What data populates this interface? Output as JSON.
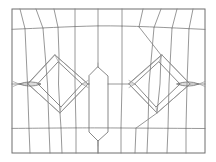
{
  "figure": {
    "kind": "mesh-diagram",
    "caption": "",
    "background_color": "#ffffff",
    "line_color": "#7d7d7d",
    "frame_color": "#6f6f6f",
    "feature_color": "#6a6a6a",
    "faint_color": "#9a9a9a"
  },
  "canvas": {
    "width": 216,
    "height": 162
  },
  "chart_data": {
    "type": "line",
    "xlabel": "",
    "ylabel": "",
    "xlim": [
      0,
      216
    ],
    "ylim": [
      0,
      162
    ],
    "grid": false,
    "legend": "none",
    "annotations": [],
    "frame": {
      "name": "outer-boundary",
      "x0": 12,
      "y0": 9,
      "x1": 205,
      "y1": 153
    },
    "horizontal_gridlines": [
      {
        "name": "top-band-line",
        "y_left": 29,
        "y_mid": 26,
        "y_right": 29,
        "points": [
          [
            12,
            29
          ],
          [
            40,
            28
          ],
          [
            70,
            26.5
          ],
          [
            100,
            25.8
          ],
          [
            130,
            26.2
          ],
          [
            160,
            27.5
          ],
          [
            186,
            28.6
          ],
          [
            205,
            29.2
          ]
        ]
      },
      {
        "name": "mid-band-line",
        "y_left": 84,
        "y_mid": 84,
        "y_right": 84,
        "points": [
          [
            12,
            84
          ],
          [
            52,
            84
          ],
          [
            98,
            84
          ],
          [
            148,
            84
          ],
          [
            205,
            84
          ]
        ]
      },
      {
        "name": "bottom-band-line",
        "y_left": 128,
        "y_mid": 128,
        "y_right": 128,
        "points": [
          [
            12,
            128
          ],
          [
            60,
            128
          ],
          [
            108,
            128
          ],
          [
            160,
            128
          ],
          [
            205,
            128
          ]
        ]
      }
    ],
    "vertical_gridlines": [
      {
        "name": "col-1",
        "x_top": 20,
        "x_bottom": 30,
        "points": [
          [
            20,
            9
          ],
          [
            25,
            29
          ],
          [
            28,
            84
          ],
          [
            29,
            128
          ],
          [
            30,
            153
          ]
        ]
      },
      {
        "name": "col-2",
        "x_top": 36,
        "x_bottom": 50,
        "points": [
          [
            36,
            9
          ],
          [
            43,
            29
          ],
          [
            48,
            84
          ],
          [
            49,
            128
          ],
          [
            50,
            153
          ]
        ]
      },
      {
        "name": "col-3",
        "x_top": 54,
        "x_bottom": 62,
        "points": [
          [
            54,
            9
          ],
          [
            58,
            29
          ],
          [
            59,
            84
          ],
          [
            61,
            128
          ],
          [
            62,
            153
          ]
        ]
      },
      {
        "name": "col-4",
        "x_top": 75,
        "x_bottom": 76,
        "points": [
          [
            75,
            9
          ],
          [
            75,
            29
          ],
          [
            75,
            84
          ],
          [
            76,
            128
          ],
          [
            76,
            153
          ]
        ]
      },
      {
        "name": "col-5",
        "x_top": 98,
        "x_bottom": 98,
        "points": [
          [
            98,
            9
          ],
          [
            98,
            29
          ],
          [
            98,
            68
          ],
          [
            98,
            140
          ],
          [
            98,
            153
          ]
        ]
      },
      {
        "name": "col-6",
        "x_top": 122,
        "x_bottom": 121,
        "points": [
          [
            122,
            9
          ],
          [
            122,
            29
          ],
          [
            122,
            84
          ],
          [
            121,
            128
          ],
          [
            121,
            153
          ]
        ]
      },
      {
        "name": "col-7",
        "x_top": 143,
        "x_bottom": 135,
        "points": [
          [
            143,
            9
          ],
          [
            139,
            29
          ],
          [
            138,
            84
          ],
          [
            136,
            128
          ],
          [
            135,
            153
          ]
        ]
      },
      {
        "name": "col-8",
        "x_top": 161,
        "x_bottom": 147,
        "points": [
          [
            161,
            9
          ],
          [
            154,
            29
          ],
          [
            149,
            84
          ],
          [
            148,
            128
          ],
          [
            147,
            153
          ]
        ]
      },
      {
        "name": "col-9",
        "x_top": 177,
        "x_bottom": 167,
        "points": [
          [
            177,
            9
          ],
          [
            172,
            29
          ],
          [
            169,
            84
          ],
          [
            168,
            128
          ],
          [
            167,
            153
          ]
        ]
      },
      {
        "name": "col-10",
        "x_top": 193,
        "x_bottom": 187,
        "points": [
          [
            193,
            9
          ],
          [
            189,
            29
          ],
          [
            187,
            84
          ],
          [
            186,
            128
          ],
          [
            186,
            153
          ]
        ]
      }
    ],
    "features": [
      {
        "name": "left-diamond",
        "type": "diamond",
        "center": [
          58,
          84
        ],
        "top": [
          55,
          55
        ],
        "bottom": [
          60,
          113
        ],
        "left": [
          28,
          84
        ],
        "right": [
          88,
          84
        ],
        "inner_top": [
          58,
          62
        ],
        "inner_bottom": [
          61,
          107
        ],
        "inner_left": [
          38,
          84
        ],
        "inner_right": [
          82,
          84
        ]
      },
      {
        "name": "right-diamond",
        "type": "diamond",
        "center": [
          160,
          84
        ],
        "top": [
          162,
          55
        ],
        "bottom": [
          157,
          113
        ],
        "left": [
          129,
          84
        ],
        "right": [
          190,
          84
        ],
        "inner_top": [
          159,
          62
        ],
        "inner_bottom": [
          156,
          107
        ],
        "inner_left": [
          135,
          84
        ],
        "inner_right": [
          180,
          84
        ]
      },
      {
        "name": "left-lens",
        "type": "lens",
        "center": [
          30,
          84
        ],
        "half_width": 11,
        "half_height": 3.5
      },
      {
        "name": "right-lens",
        "type": "lens",
        "center": [
          188,
          84
        ],
        "half_width": 11,
        "half_height": 3.5
      },
      {
        "name": "center-capsule",
        "type": "capsule",
        "top_apex": [
          98,
          67
        ],
        "bottom_apex": [
          98,
          141
        ],
        "left_x": 89,
        "right_x": 108,
        "shoulder_top_y": 76,
        "shoulder_bottom_y": 132
      }
    ]
  }
}
